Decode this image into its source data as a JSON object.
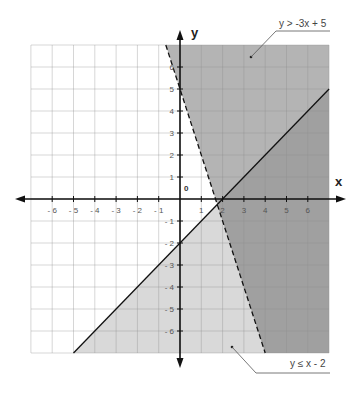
{
  "chart_data": {
    "type": "area",
    "title": "",
    "xlabel": "x",
    "ylabel": "y",
    "xlim": [
      -7,
      7
    ],
    "ylim": [
      -7,
      7
    ],
    "grid": true,
    "x_ticks": [
      -6,
      -5,
      -4,
      -3,
      -2,
      -1,
      1,
      2,
      3,
      4,
      5,
      6
    ],
    "y_ticks": [
      6,
      5,
      4,
      3,
      2,
      1,
      -1,
      -2,
      -3,
      -4,
      -5,
      -6
    ],
    "x_tick_labels": [
      "- 6",
      "- 5",
      "- 4",
      "- 3",
      "- 2",
      "- 1",
      "1",
      "2",
      "3",
      "4",
      "5",
      "6"
    ],
    "y_tick_labels": [
      "6",
      "5",
      "4",
      "3",
      "2",
      "1",
      "- 1",
      "- 2",
      "- 3",
      "- 4",
      "- 5",
      "- 6"
    ],
    "origin_label": "0",
    "series": [
      {
        "name": "y > -3x + 5",
        "kind": "inequality",
        "boundary": {
          "slope": -3,
          "intercept": 5,
          "style": "dashed"
        },
        "shade": "above",
        "color": "#b4b4b4",
        "points": [
          [
            -0.667,
            7
          ],
          [
            4,
            -7
          ]
        ]
      },
      {
        "name": "y ≤ x - 2",
        "kind": "inequality",
        "boundary": {
          "slope": 1,
          "intercept": -2,
          "style": "solid"
        },
        "shade": "below",
        "color": "#d9d9d9",
        "points": [
          [
            -5,
            -7
          ],
          [
            7,
            5
          ]
        ]
      }
    ],
    "overlap_color": "#a0a0a0",
    "intersection": [
      1.75,
      -0.25
    ],
    "annotations": [
      {
        "text": "y > -3x + 5",
        "position": "top-right"
      },
      {
        "text": "y ≤ x - 2",
        "position": "bottom-right"
      }
    ]
  },
  "labels": {
    "x_axis": "x",
    "y_axis": "y",
    "origin": "0",
    "annotation_top": "y > -3x + 5",
    "annotation_bottom": "y ≤ x - 2"
  }
}
